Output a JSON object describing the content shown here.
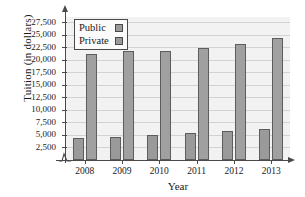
{
  "chart_data": {
    "type": "bar",
    "title": "",
    "xlabel": "Year",
    "ylabel": "Tuition (in dollars)",
    "categories": [
      "2008",
      "2009",
      "2010",
      "2011",
      "2012",
      "2013"
    ],
    "series": [
      {
        "name": "Public",
        "values": [
          4300,
          4500,
          4900,
          5300,
          5800,
          6100
        ]
      },
      {
        "name": "Private",
        "values": [
          21100,
          21800,
          21800,
          22400,
          23100,
          24300
        ]
      }
    ],
    "ylim": [
      0,
      28500
    ],
    "yticks": [
      2500,
      5000,
      7500,
      10000,
      12500,
      15000,
      17500,
      20000,
      22500,
      25000,
      27500
    ],
    "ytick_labels": [
      "2,500",
      "5,000",
      "7,500",
      "10,000",
      "12,500",
      "15,000",
      "17,500",
      "20,000",
      "22,500",
      "25,000",
      "27,500"
    ],
    "grid": true,
    "legend_position": "upper-left",
    "axis_break": true,
    "colors": {
      "public_bar": "#9a9a9a",
      "private_bar": "#a0a0a0",
      "bar_border": "#5d5d5d",
      "plot_background": "#f2f2f2",
      "gridline": "#d2d2d2",
      "axis": "#4a4a4a",
      "text": "#1a1a1a"
    }
  },
  "legend": {
    "items": [
      {
        "label": "Public"
      },
      {
        "label": "Private"
      }
    ]
  }
}
